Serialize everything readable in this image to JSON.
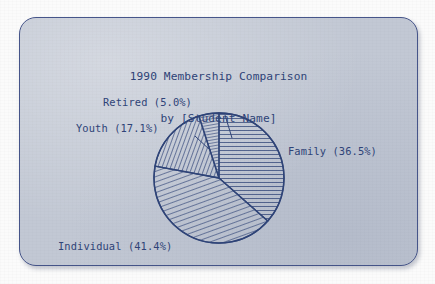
{
  "document": {
    "kind": "printed-slide-photograph",
    "page_background": "#fbfbfb",
    "card_background": "#c2c8d4",
    "ink_color": "#2f4478",
    "border_color": "#46558a"
  },
  "title": {
    "line1": "1990 Membership Comparison",
    "line2": "by [Student Name]"
  },
  "chart_data": {
    "type": "pie",
    "title": "1990 Membership Comparison",
    "subtitle": "by [Student Name]",
    "xlabel": "",
    "ylabel": "",
    "grid": false,
    "legend": "none",
    "labels_position": "outside-with-leader-lines",
    "units": "percent",
    "start_angle_deg": 0,
    "direction": "clockwise",
    "center": {
      "x": 218,
      "y": 177
    },
    "radius": 65,
    "categories": [
      "Family",
      "Individual",
      "Youth",
      "Retired"
    ],
    "values": [
      36.5,
      41.4,
      17.1,
      5.0
    ],
    "total": 100.0,
    "slices": [
      {
        "name": "Family",
        "value": 36.5,
        "label": "Family (36.5%)",
        "hatch": "vertical",
        "hatch_angle_deg": 90,
        "start_deg": 0.0,
        "end_deg": 131.4,
        "label_anchor": "left"
      },
      {
        "name": "Individual",
        "value": 41.4,
        "label": "Individual (41.4%)",
        "hatch": "steep-diagonal",
        "hatch_angle_deg": 70,
        "start_deg": 131.4,
        "end_deg": 280.4,
        "label_anchor": "right"
      },
      {
        "name": "Youth",
        "value": 17.1,
        "label": "Youth (17.1%)",
        "hatch": "shallow-diagonal",
        "hatch_angle_deg": 20,
        "start_deg": 280.4,
        "end_deg": 342.0,
        "label_anchor": "right"
      },
      {
        "name": "Retired",
        "value": 5.0,
        "label": "Retired (5.0%)",
        "hatch": "near-vertical",
        "hatch_angle_deg": 80,
        "start_deg": 342.0,
        "end_deg": 360.0,
        "label_anchor": "right"
      }
    ]
  },
  "labels": {
    "retired": "Retired (5.0%)",
    "youth": "Youth (17.1%)",
    "family": "Family (36.5%)",
    "individual": "Individual (41.4%)"
  }
}
